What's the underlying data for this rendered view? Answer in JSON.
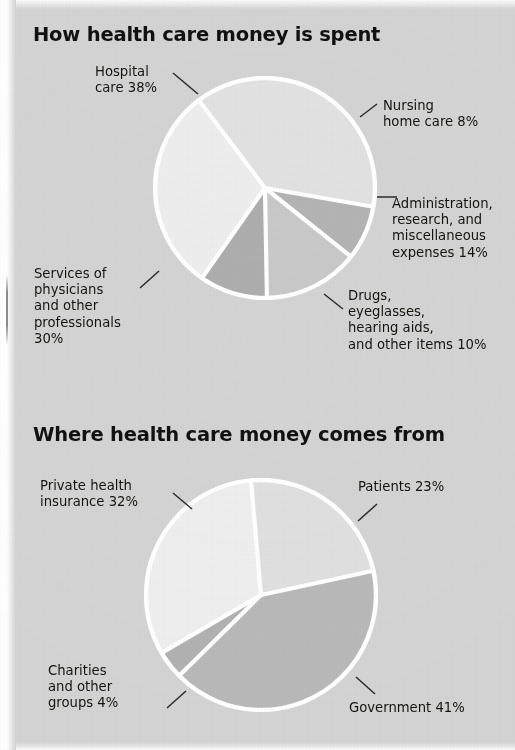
{
  "page": {
    "background_color": "#d4d4d4",
    "text_color": "#14140f"
  },
  "charts": [
    {
      "id": "health-care-spending",
      "title": "How health care money is spent",
      "labels": {
        "hospital": "Hospital\ncare 38%",
        "nursing": "Nursing\nhome care 8%",
        "admin": "Administration,\nresearch, and\nmiscellaneous\nexpenses 14%",
        "drugs": "Drugs,\neyeglasses,\nhearing aids,\nand other items 10%",
        "services": "Services of\nphysicians\nand other\nprofessionals\n30%"
      }
    },
    {
      "id": "health-care-sources",
      "title": "Where health care money comes from",
      "labels": {
        "private": "Private health\ninsurance 32%",
        "patients": "Patients 23%",
        "charities": "Charities\nand other\ngroups 4%",
        "government": "Government 41%"
      }
    }
  ],
  "chart_data": [
    {
      "type": "pie",
      "title": "How health care money is spent",
      "xlabel": "",
      "ylabel": "",
      "units": "percent",
      "legend": "callout-labels",
      "categories": [
        "Hospital care",
        "Nursing home care",
        "Administration, research, and miscellaneous expenses",
        "Drugs, eyeglasses, hearing aids, and other items",
        "Services of physicians and other professionals"
      ],
      "values": [
        38,
        8,
        14,
        10,
        30
      ],
      "slice_colors": [
        "#e2e2e2",
        "#b4b4b4",
        "#c9c9c9",
        "#aeaeae",
        "#eeeeee"
      ],
      "start_angle_deg": 0,
      "direction": "clockwise",
      "separator_color": "#ffffff"
    },
    {
      "type": "pie",
      "title": "Where health care money comes from",
      "xlabel": "",
      "ylabel": "",
      "units": "percent",
      "legend": "callout-labels",
      "categories": [
        "Patients",
        "Government",
        "Charities and other groups",
        "Private health insurance"
      ],
      "values": [
        23,
        41,
        4,
        32
      ],
      "slice_colors": [
        "#e0e0e0",
        "#b9b9b9",
        "#b2b2b2",
        "#efefef"
      ],
      "start_angle_deg": 0,
      "direction": "clockwise",
      "separator_color": "#ffffff"
    }
  ]
}
